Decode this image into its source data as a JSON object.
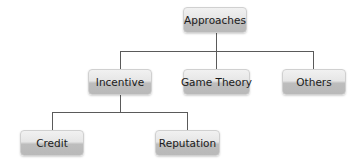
{
  "diagram": {
    "type": "tree",
    "root": {
      "label": "Approaches",
      "children": [
        {
          "label": "Incentive",
          "children": [
            {
              "label": "Credit"
            },
            {
              "label": "Reputation"
            }
          ]
        },
        {
          "label": "Game Theory"
        },
        {
          "label": "Others"
        }
      ]
    },
    "nodes": {
      "approaches": "Approaches",
      "incentive": "Incentive",
      "game_theory": "Game Theory",
      "others": "Others",
      "credit": "Credit",
      "reputation": "Reputation"
    },
    "edges": [
      [
        "Approaches",
        "Incentive"
      ],
      [
        "Approaches",
        "Game Theory"
      ],
      [
        "Approaches",
        "Others"
      ],
      [
        "Incentive",
        "Credit"
      ],
      [
        "Incentive",
        "Reputation"
      ]
    ]
  }
}
